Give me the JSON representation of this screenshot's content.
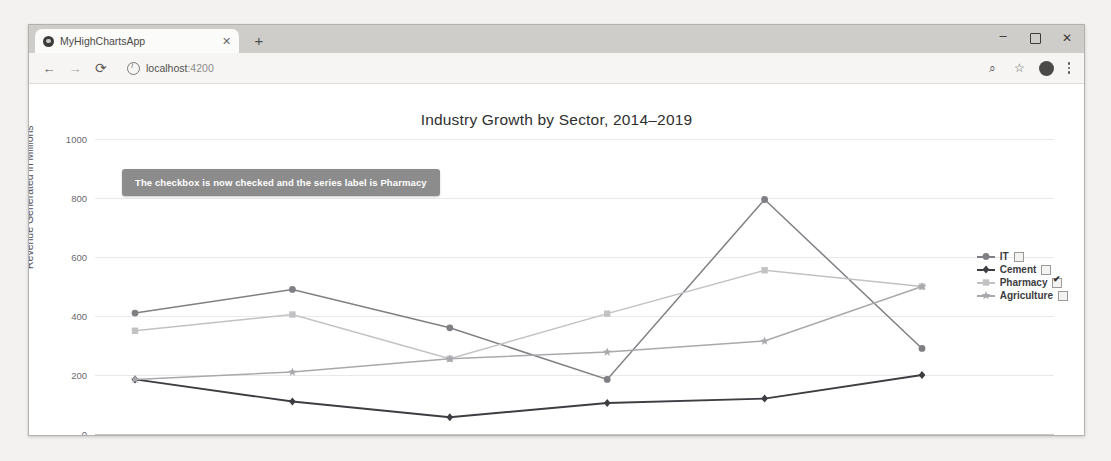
{
  "browser": {
    "tab": {
      "title": "MyHighChartsApp",
      "close_label": "✕",
      "favicon_name": "app-favicon"
    },
    "new_tab_label": "+",
    "window_controls": {
      "minimize": "–",
      "maximize": "",
      "close": "✕"
    },
    "toolbar": {
      "back": "←",
      "forward": "→",
      "reload": "⟳",
      "url_host": "localhost",
      "url_port": ":4200",
      "zoom_icon": "⌕",
      "bookmark_icon": "☆",
      "profile_icon": "avatar",
      "menu_icon": "⋮"
    }
  },
  "message_box": {
    "text": "The checkbox is now checked and the series label is Pharmacy"
  },
  "chart_data": {
    "type": "line",
    "title": "Industry Growth by Sector, 2014–2019",
    "xlabel": "",
    "ylabel": "Revenue Generated in Millions",
    "categories": [
      "2014",
      "2015",
      "2016",
      "2017",
      "2018",
      "2019"
    ],
    "yticks": [
      "0",
      "200",
      "400",
      "600",
      "800",
      "1000"
    ],
    "ylim": [
      0,
      1000
    ],
    "grid": true,
    "legend_position": "right",
    "series": [
      {
        "name": "IT",
        "color": "#7f7f84",
        "marker": "circle",
        "checked": false,
        "values": [
          410,
          490,
          360,
          185,
          795,
          290
        ]
      },
      {
        "name": "Cement",
        "color": "#3d3d42",
        "marker": "diamond",
        "checked": false,
        "values": [
          185,
          110,
          57,
          105,
          120,
          200
        ]
      },
      {
        "name": "Pharmacy",
        "color": "#c2c2c4",
        "marker": "square",
        "checked": true,
        "values": [
          350,
          405,
          255,
          408,
          555,
          500
        ]
      },
      {
        "name": "Agriculture",
        "color": "#a9a9ad",
        "marker": "star",
        "checked": false,
        "values": [
          185,
          210,
          255,
          278,
          315,
          500
        ]
      }
    ]
  }
}
